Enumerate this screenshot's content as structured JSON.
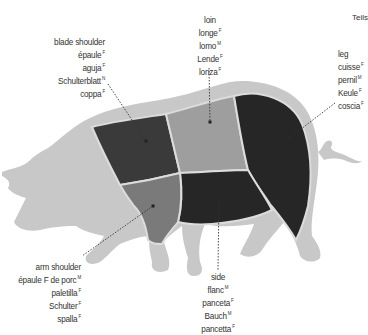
{
  "corner_text": "Teils",
  "colors": {
    "body": "#c8c8c8",
    "blade_shoulder": "#3a3a3a",
    "loin": "#9e9e9e",
    "leg": "#262626",
    "side": "#262626",
    "arm_shoulder": "#7a7a7a",
    "outline": "#dcdcdc"
  },
  "cuts": {
    "blade_shoulder": {
      "english": "blade shoulder",
      "translations": [
        {
          "word": "épaule",
          "gender": "F"
        },
        {
          "word": "aguja",
          "gender": "F"
        },
        {
          "word": "Schulterblatt",
          "gender": "N"
        },
        {
          "word": "coppa",
          "gender": "F"
        }
      ]
    },
    "loin": {
      "english": "loin",
      "translations": [
        {
          "word": "longe",
          "gender": "F"
        },
        {
          "word": "lomo",
          "gender": "M"
        },
        {
          "word": "Lende",
          "gender": "F"
        },
        {
          "word": "lonza",
          "gender": "F"
        }
      ]
    },
    "leg": {
      "english": "leg",
      "translations": [
        {
          "word": "cuisse",
          "gender": "F"
        },
        {
          "word": "pernil",
          "gender": "M"
        },
        {
          "word": "Keule",
          "gender": "F"
        },
        {
          "word": "coscia",
          "gender": "F"
        }
      ]
    },
    "arm_shoulder": {
      "english": "arm shoulder",
      "translations": [
        {
          "word": "épaule F de porc",
          "gender": "M"
        },
        {
          "word": "paletilla",
          "gender": "F"
        },
        {
          "word": "Schulter",
          "gender": "F"
        },
        {
          "word": "spalla",
          "gender": "F"
        }
      ]
    },
    "side": {
      "english": "side",
      "translations": [
        {
          "word": "flanc",
          "gender": "M"
        },
        {
          "word": "panceta",
          "gender": "F"
        },
        {
          "word": "Bauch",
          "gender": "M"
        },
        {
          "word": "pancetta",
          "gender": "F"
        }
      ]
    }
  }
}
